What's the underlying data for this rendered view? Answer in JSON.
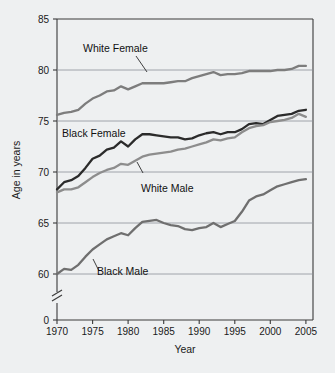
{
  "chart_data": {
    "type": "line",
    "title": "",
    "xlabel": "Year",
    "ylabel": "Age in years",
    "xlim": [
      1970,
      2006
    ],
    "ylim": [
      57.5,
      85
    ],
    "y_axis_break": true,
    "y_zero_label": "0",
    "grid": true,
    "legend_position": "inline-annotations",
    "xticks": [
      1970,
      1975,
      1980,
      1985,
      1990,
      1995,
      2000,
      2005
    ],
    "xtick_labels": [
      "1970",
      "1975",
      "1980",
      "1985",
      "1990",
      "1995",
      "2000",
      "2005"
    ],
    "yticks": [
      60,
      65,
      70,
      75,
      80,
      85
    ],
    "ytick_labels": [
      "60",
      "65",
      "70",
      "75",
      "80",
      "85"
    ],
    "x": [
      1970,
      1971,
      1972,
      1973,
      1974,
      1975,
      1976,
      1977,
      1978,
      1979,
      1980,
      1981,
      1982,
      1983,
      1984,
      1985,
      1986,
      1987,
      1988,
      1989,
      1990,
      1991,
      1992,
      1993,
      1994,
      1995,
      1996,
      1997,
      1998,
      1999,
      2000,
      2001,
      2002,
      2003,
      2004,
      2005
    ],
    "series": [
      {
        "name": "White Female",
        "color": "#7d7d7d",
        "values": [
          75.6,
          75.8,
          75.9,
          76.1,
          76.7,
          77.2,
          77.5,
          77.9,
          78.0,
          78.4,
          78.1,
          78.4,
          78.7,
          78.7,
          78.7,
          78.7,
          78.8,
          78.9,
          78.9,
          79.2,
          79.4,
          79.6,
          79.8,
          79.5,
          79.6,
          79.6,
          79.7,
          79.9,
          79.9,
          79.9,
          79.9,
          80.0,
          80.0,
          80.1,
          80.4,
          80.4
        ]
      },
      {
        "name": "Black Female",
        "color": "#2b2b2b",
        "values": [
          68.3,
          69.0,
          69.2,
          69.6,
          70.4,
          71.3,
          71.6,
          72.2,
          72.4,
          73.0,
          72.5,
          73.2,
          73.7,
          73.7,
          73.6,
          73.5,
          73.4,
          73.4,
          73.2,
          73.3,
          73.6,
          73.8,
          73.9,
          73.7,
          73.9,
          73.9,
          74.2,
          74.7,
          74.8,
          74.7,
          75.1,
          75.5,
          75.6,
          75.7,
          76.0,
          76.1
        ]
      },
      {
        "name": "White Male",
        "color": "#8d8d8d",
        "values": [
          68.0,
          68.3,
          68.3,
          68.5,
          69.0,
          69.5,
          69.9,
          70.2,
          70.4,
          70.8,
          70.7,
          71.1,
          71.5,
          71.7,
          71.8,
          71.9,
          72.0,
          72.2,
          72.3,
          72.5,
          72.7,
          72.9,
          73.2,
          73.1,
          73.3,
          73.4,
          73.9,
          74.3,
          74.5,
          74.6,
          74.9,
          75.0,
          75.1,
          75.3,
          75.7,
          75.4
        ]
      },
      {
        "name": "Black Male",
        "color": "#6f6f6f",
        "values": [
          60.0,
          60.5,
          60.4,
          60.9,
          61.7,
          62.4,
          62.9,
          63.4,
          63.7,
          64.0,
          63.8,
          64.5,
          65.1,
          65.2,
          65.3,
          65.0,
          64.8,
          64.7,
          64.4,
          64.3,
          64.5,
          64.6,
          65.0,
          64.6,
          64.9,
          65.2,
          66.1,
          67.2,
          67.6,
          67.8,
          68.2,
          68.6,
          68.8,
          69.0,
          69.2,
          69.3
        ]
      }
    ],
    "annotations": [
      {
        "text": "White Female",
        "target_series": "White Female"
      },
      {
        "text": "Black Female",
        "target_series": "Black Female"
      },
      {
        "text": "White Male",
        "target_series": "White Male"
      },
      {
        "text": "Black Male",
        "target_series": "Black Male"
      }
    ]
  },
  "colors": {
    "background": "#eef0f1",
    "axis": "#3a3a3a",
    "grid": "#8a9199",
    "text": "#1a1a1a"
  }
}
